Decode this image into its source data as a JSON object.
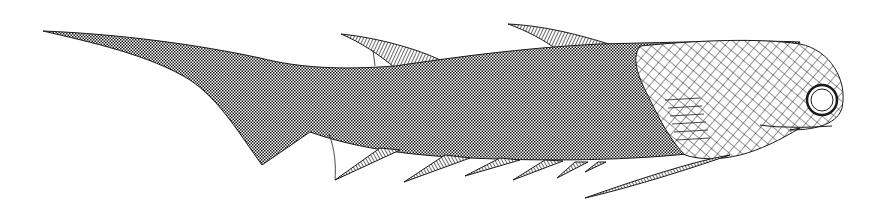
{
  "illustration": {
    "subject": "acanthodian fish reconstruction",
    "style": "black and white line drawing",
    "colors": {
      "background": "#ffffff",
      "ink": "#1a1a1a",
      "body_fill": "#8a8a8a",
      "head_fill": "#f2f2f2"
    },
    "parts": [
      "tail",
      "body",
      "dorsal-fin-front",
      "dorsal-fin-rear",
      "pectoral-fin",
      "ventral-spines",
      "anal-fin",
      "head",
      "eye",
      "operculum"
    ]
  }
}
